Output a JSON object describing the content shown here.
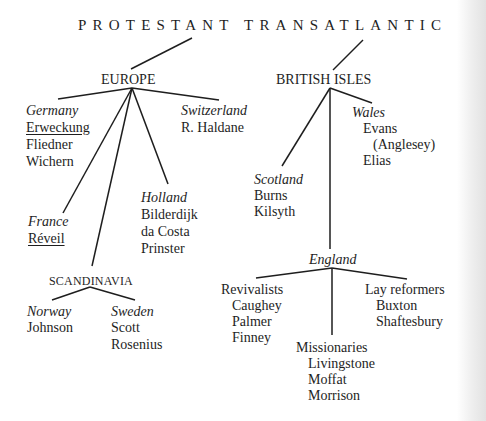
{
  "title": "PROTESTANT TRANSATLANTIC",
  "europe": {
    "label": "EUROPE",
    "germany": {
      "name": "Germany",
      "items": [
        "Erweckung",
        "Fliedner",
        "Wichern"
      ]
    },
    "switzerland": {
      "name": "Switzerland",
      "items": [
        "R. Haldane"
      ]
    },
    "france": {
      "name": "France",
      "items": [
        "Réveil"
      ]
    },
    "holland": {
      "name": "Holland",
      "items": [
        "Bilderdijk",
        "da Costa",
        "Prinster"
      ]
    },
    "scandinavia": {
      "label": "SCANDINAVIA",
      "norway": {
        "name": "Norway",
        "items": [
          "Johnson"
        ]
      },
      "sweden": {
        "name": "Sweden",
        "items": [
          "Scott",
          "Rosenius"
        ]
      }
    }
  },
  "british_isles": {
    "label": "BRITISH ISLES",
    "wales": {
      "name": "Wales",
      "items": [
        "Evans",
        "(Anglesey)",
        "Elias"
      ]
    },
    "scotland": {
      "name": "Scotland",
      "items": [
        "Burns",
        "Kilsyth"
      ]
    },
    "england": {
      "name": "England",
      "revivalists": {
        "label": "Revivalists",
        "items": [
          "Caughey",
          "Palmer",
          "Finney"
        ]
      },
      "missionaries": {
        "label": "Missionaries",
        "items": [
          "Livingstone",
          "Moffat",
          "Morrison"
        ]
      },
      "lay_reformers": {
        "label": "Lay reformers",
        "items": [
          "Buxton",
          "Shaftesbury"
        ]
      }
    }
  }
}
